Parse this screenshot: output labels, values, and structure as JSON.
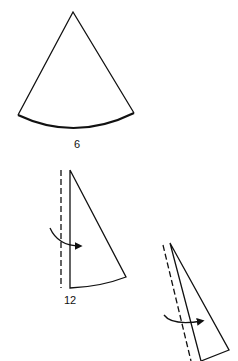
{
  "diagram": {
    "figures": [
      {
        "name": "sector",
        "label": "6"
      },
      {
        "name": "folded-sector-first",
        "label": "12"
      },
      {
        "name": "folded-sector-second",
        "label": ""
      }
    ],
    "colors": {
      "stroke": "#111111",
      "background": "#ffffff"
    }
  }
}
